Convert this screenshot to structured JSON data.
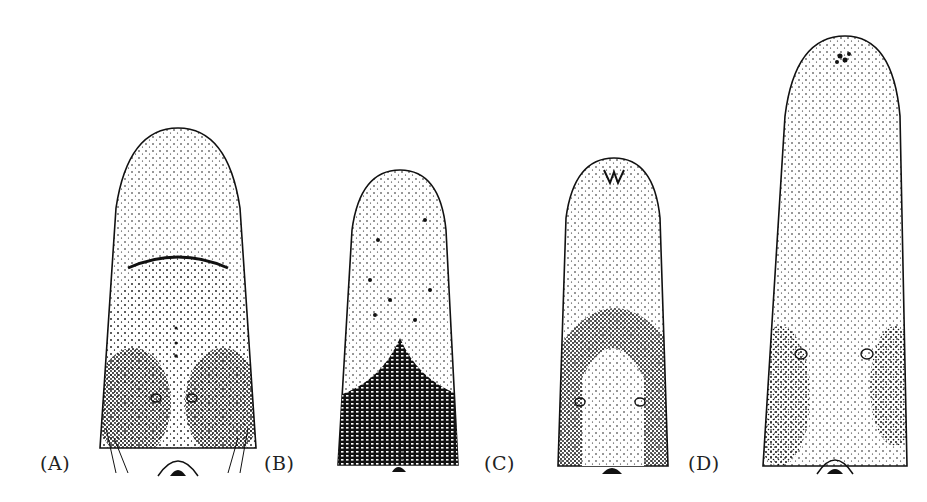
{
  "figure": {
    "panels": [
      {
        "label": "(A)"
      },
      {
        "label": "(B)"
      },
      {
        "label": "(C)"
      },
      {
        "label": "(D)"
      }
    ],
    "colors": {
      "ink": "#111111",
      "background": "#ffffff"
    }
  }
}
